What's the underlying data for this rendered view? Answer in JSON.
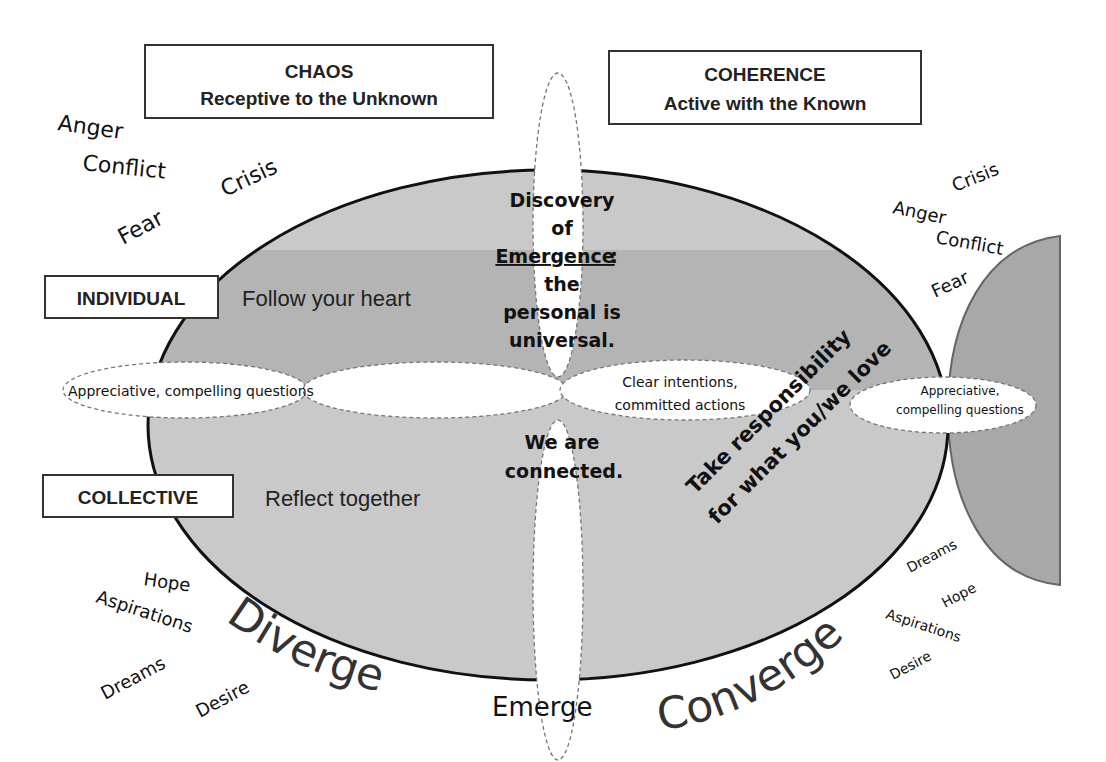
{
  "colors": {
    "background": "#ffffff",
    "main_ellipse_fill": "#c9c9c9",
    "main_ellipse_upper_band": "#b4b4b4",
    "right_ellipse_fill": "#a8a8a8",
    "outline": "#111111",
    "petal_fill": "#ffffff",
    "petal_stroke": "#777777"
  },
  "headers": {
    "chaos": {
      "title": "CHAOS",
      "subtitle": "Receptive to the Unknown"
    },
    "coherence": {
      "title": "COHERENCE",
      "subtitle": "Active with the Known"
    }
  },
  "row_labels": {
    "individual": {
      "label": "INDIVIDUAL",
      "text": "Follow your heart"
    },
    "collective": {
      "label": "COLLECTIVE",
      "text": "Reflect together"
    }
  },
  "left_top_words": [
    "Anger",
    "Conflict",
    "Crisis",
    "Fear"
  ],
  "right_top_words": [
    "Crisis",
    "Anger",
    "Conflict",
    "Fear"
  ],
  "left_bottom_words": [
    "Hope",
    "Aspirations",
    "Dreams",
    "Desire"
  ],
  "right_bottom_words": [
    "Dreams",
    "Hope",
    "Aspirations",
    "Desire"
  ],
  "center": {
    "upper": [
      "Discovery",
      "of",
      "Emergence",
      ":",
      "the",
      "personal is",
      "universal."
    ],
    "lower": [
      "We are",
      "connected."
    ]
  },
  "petals": {
    "left": "Appreciative, compelling questions",
    "middle_line1": "Clear intentions,",
    "middle_line2": "committed actions",
    "right_line1": "Appreciative,",
    "right_line2": "compelling questions"
  },
  "diagonal": {
    "line1": "Take responsibility",
    "line2": "for what you/we love"
  },
  "phases": {
    "diverge": "Diverge",
    "emerge": "Emerge",
    "converge": "Converge"
  }
}
